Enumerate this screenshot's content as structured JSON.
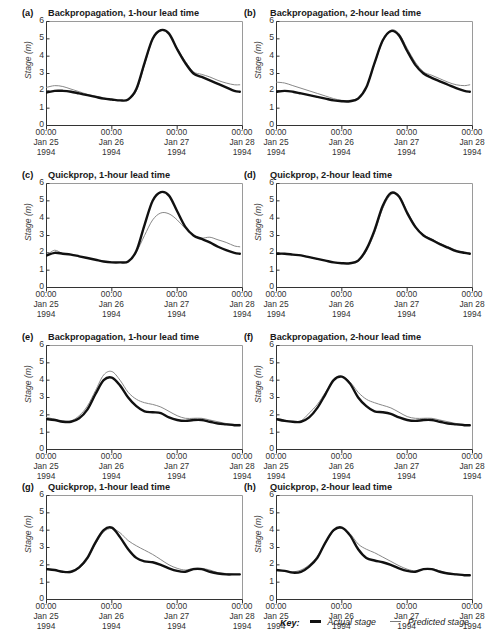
{
  "figure": {
    "axis": {
      "ylabel": "Stage (m)",
      "yticks": [
        "6",
        "5",
        "4",
        "3",
        "2",
        "1",
        "0"
      ],
      "ylim": [
        0,
        6
      ],
      "xticks": [
        {
          "time": "00:00",
          "date": "Jan 25",
          "year": "1994"
        },
        {
          "time": "00:00",
          "date": "Jan 26",
          "year": "1994"
        },
        {
          "time": "00:00",
          "date": "Jan 27",
          "year": "1994"
        },
        {
          "time": "00:00",
          "date": "Jan 28",
          "year": "1994"
        }
      ]
    },
    "key": {
      "label": "Key:",
      "items": [
        {
          "name": "actual-stage",
          "text": "Actual stage",
          "color": "#111111",
          "width": 2.6
        },
        {
          "name": "predicted-stage",
          "text": "Predicted stage",
          "color": "#7a7a7a",
          "width": 1.2
        }
      ]
    },
    "panels": [
      {
        "letter": "(a)",
        "title": "Backpropagation, 1-hour lead time"
      },
      {
        "letter": "(b)",
        "title": "Backpropagation, 2-hour lead time"
      },
      {
        "letter": "(c)",
        "title": "Quickprop, 1-hour lead time"
      },
      {
        "letter": "(d)",
        "title": "Quickprop, 2-hour lead time"
      },
      {
        "letter": "(e)",
        "title": "Backpropagation, 1-hour lead time"
      },
      {
        "letter": "(f)",
        "title": "Backpropagation, 2-hour lead time"
      },
      {
        "letter": "(g)",
        "title": "Quickprop, 1-hour lead time"
      },
      {
        "letter": "(h)",
        "title": "Quickprop, 2-hour lead time"
      }
    ]
  },
  "chart_data": [
    {
      "panel": "(a)",
      "type": "line",
      "title": "Backpropagation, 1-hour lead time",
      "xlabel": "",
      "ylabel": "Stage (m)",
      "ylim": [
        0,
        6
      ],
      "xlim": [
        0,
        72
      ],
      "x_unit": "hours from 00:00 Jan 25 1994",
      "grid": false,
      "legend": "bottom",
      "x": [
        0,
        3,
        6,
        9,
        12,
        15,
        18,
        21,
        24,
        27,
        30,
        33,
        36,
        39,
        42,
        45,
        48,
        51,
        54,
        57,
        60,
        63,
        66,
        69,
        71
      ],
      "series": [
        {
          "name": "Actual stage",
          "values": [
            1.9,
            2.0,
            2.0,
            1.95,
            1.85,
            1.75,
            1.65,
            1.55,
            1.5,
            1.45,
            1.5,
            2.1,
            3.6,
            5.0,
            5.5,
            5.3,
            4.4,
            3.6,
            3.0,
            2.8,
            2.6,
            2.4,
            2.2,
            2.0,
            1.95
          ]
        },
        {
          "name": "Predicted stage",
          "values": [
            2.2,
            2.3,
            2.25,
            2.1,
            1.95,
            1.8,
            1.7,
            1.6,
            1.5,
            1.45,
            1.5,
            2.0,
            3.5,
            4.95,
            5.45,
            5.3,
            4.45,
            3.7,
            3.1,
            2.95,
            2.8,
            2.6,
            2.45,
            2.35,
            2.35
          ]
        }
      ]
    },
    {
      "panel": "(b)",
      "type": "line",
      "title": "Backpropagation, 2-hour lead time",
      "xlabel": "",
      "ylabel": "Stage (m)",
      "ylim": [
        0,
        6
      ],
      "xlim": [
        0,
        72
      ],
      "x_unit": "hours from 00:00 Jan 25 1994",
      "grid": false,
      "legend": "bottom",
      "x": [
        0,
        3,
        6,
        9,
        12,
        15,
        18,
        21,
        24,
        27,
        30,
        33,
        36,
        39,
        42,
        45,
        48,
        51,
        54,
        57,
        60,
        63,
        66,
        69,
        71
      ],
      "series": [
        {
          "name": "Actual stage",
          "values": [
            1.95,
            2.0,
            1.95,
            1.85,
            1.75,
            1.65,
            1.55,
            1.45,
            1.4,
            1.4,
            1.55,
            2.2,
            3.6,
            4.9,
            5.45,
            5.2,
            4.3,
            3.5,
            3.0,
            2.75,
            2.55,
            2.35,
            2.15,
            2.0,
            1.95
          ]
        },
        {
          "name": "Predicted stage",
          "values": [
            2.5,
            2.45,
            2.3,
            2.15,
            2.0,
            1.85,
            1.7,
            1.55,
            1.45,
            1.45,
            1.6,
            2.2,
            3.55,
            4.85,
            5.5,
            5.3,
            4.45,
            3.65,
            3.1,
            2.9,
            2.7,
            2.5,
            2.35,
            2.3,
            2.35
          ]
        }
      ]
    },
    {
      "panel": "(c)",
      "type": "line",
      "title": "Quickprop, 1-hour lead time",
      "xlabel": "",
      "ylabel": "Stage (m)",
      "ylim": [
        0,
        6
      ],
      "xlim": [
        0,
        72
      ],
      "x_unit": "hours from 00:00 Jan 25 1994",
      "grid": false,
      "legend": "bottom",
      "x": [
        0,
        3,
        6,
        9,
        12,
        15,
        18,
        21,
        24,
        27,
        30,
        33,
        36,
        39,
        42,
        45,
        48,
        51,
        54,
        57,
        60,
        63,
        66,
        69,
        71
      ],
      "series": [
        {
          "name": "Actual stage",
          "values": [
            1.85,
            2.0,
            1.95,
            1.9,
            1.8,
            1.7,
            1.6,
            1.5,
            1.45,
            1.45,
            1.5,
            2.1,
            3.6,
            5.0,
            5.5,
            5.3,
            4.4,
            3.5,
            3.0,
            2.8,
            2.6,
            2.35,
            2.15,
            2.0,
            1.95
          ]
        },
        {
          "name": "Predicted stage",
          "values": [
            1.85,
            2.15,
            1.95,
            1.9,
            1.8,
            1.7,
            1.6,
            1.5,
            1.45,
            1.45,
            1.5,
            2.05,
            3.0,
            3.9,
            4.3,
            4.25,
            3.9,
            3.4,
            3.0,
            2.85,
            2.9,
            2.75,
            2.6,
            2.4,
            2.35
          ]
        }
      ]
    },
    {
      "panel": "(d)",
      "type": "line",
      "title": "Quickprop, 2-hour lead time",
      "xlabel": "",
      "ylabel": "Stage (m)",
      "ylim": [
        0,
        6
      ],
      "xlim": [
        0,
        72
      ],
      "x_unit": "hours from 00:00 Jan 25 1994",
      "grid": false,
      "legend": "bottom",
      "x": [
        0,
        3,
        6,
        9,
        12,
        15,
        18,
        21,
        24,
        27,
        30,
        33,
        36,
        39,
        42,
        45,
        48,
        51,
        54,
        57,
        60,
        63,
        66,
        69,
        71
      ],
      "series": [
        {
          "name": "Actual stage",
          "values": [
            1.95,
            1.95,
            1.9,
            1.85,
            1.75,
            1.65,
            1.55,
            1.45,
            1.4,
            1.4,
            1.55,
            2.2,
            3.3,
            4.7,
            5.45,
            5.25,
            4.3,
            3.5,
            3.0,
            2.75,
            2.5,
            2.3,
            2.1,
            2.0,
            1.95
          ]
        },
        {
          "name": "Predicted stage",
          "values": [
            1.95,
            1.95,
            1.9,
            1.85,
            1.75,
            1.65,
            1.55,
            1.45,
            1.4,
            1.4,
            1.5,
            2.1,
            3.15,
            4.55,
            5.35,
            5.3,
            4.4,
            3.55,
            3.05,
            2.8,
            2.55,
            2.35,
            2.15,
            2.05,
            2.0
          ]
        }
      ]
    },
    {
      "panel": "(e)",
      "type": "line",
      "title": "Backpropagation, 1-hour lead time",
      "xlabel": "",
      "ylabel": "Stage (m)",
      "ylim": [
        0,
        6
      ],
      "xlim": [
        0,
        72
      ],
      "x_unit": "hours from 00:00 Jan 25 1994",
      "grid": false,
      "legend": "bottom",
      "x": [
        0,
        3,
        6,
        9,
        12,
        15,
        18,
        21,
        24,
        27,
        30,
        33,
        36,
        39,
        42,
        45,
        48,
        51,
        54,
        57,
        60,
        63,
        66,
        69,
        71
      ],
      "series": [
        {
          "name": "Actual stage",
          "values": [
            1.75,
            1.7,
            1.6,
            1.6,
            1.8,
            2.3,
            3.2,
            4.0,
            4.15,
            3.7,
            3.0,
            2.5,
            2.2,
            2.15,
            2.1,
            1.85,
            1.7,
            1.65,
            1.7,
            1.7,
            1.6,
            1.5,
            1.45,
            1.4,
            1.4
          ]
        },
        {
          "name": "Predicted stage",
          "values": [
            1.85,
            1.75,
            1.65,
            1.65,
            1.95,
            2.5,
            3.4,
            4.3,
            4.5,
            4.0,
            3.3,
            2.9,
            2.7,
            2.6,
            2.45,
            2.2,
            1.95,
            1.8,
            1.8,
            1.8,
            1.7,
            1.6,
            1.5,
            1.45,
            1.45
          ]
        }
      ]
    },
    {
      "panel": "(f)",
      "type": "line",
      "title": "Backpropagation, 2-hour lead time",
      "xlabel": "",
      "ylabel": "Stage (m)",
      "ylim": [
        0,
        6
      ],
      "xlim": [
        0,
        72
      ],
      "x_unit": "hours from 00:00 Jan 25 1994",
      "grid": false,
      "legend": "bottom",
      "x": [
        0,
        3,
        6,
        9,
        12,
        15,
        18,
        21,
        24,
        27,
        30,
        33,
        36,
        39,
        42,
        45,
        48,
        51,
        54,
        57,
        60,
        63,
        66,
        69,
        71
      ],
      "series": [
        {
          "name": "Actual stage",
          "values": [
            1.75,
            1.65,
            1.6,
            1.6,
            1.85,
            2.4,
            3.2,
            4.0,
            4.2,
            3.8,
            3.0,
            2.5,
            2.2,
            2.15,
            2.05,
            1.85,
            1.7,
            1.65,
            1.7,
            1.7,
            1.6,
            1.5,
            1.45,
            1.4,
            1.4
          ]
        },
        {
          "name": "Predicted stage",
          "values": [
            1.8,
            1.7,
            1.6,
            1.65,
            2.1,
            2.6,
            3.3,
            4.0,
            4.2,
            3.9,
            3.3,
            2.9,
            2.7,
            2.55,
            2.4,
            2.15,
            1.9,
            1.8,
            1.8,
            1.8,
            1.7,
            1.6,
            1.5,
            1.45,
            1.4
          ]
        }
      ]
    },
    {
      "panel": "(g)",
      "type": "line",
      "title": "Quickprop, 1-hour lead time",
      "xlabel": "",
      "ylabel": "Stage (m)",
      "ylim": [
        0,
        6
      ],
      "xlim": [
        0,
        72
      ],
      "x_unit": "hours from 00:00 Jan 25 1994",
      "grid": false,
      "legend": "bottom",
      "x": [
        0,
        3,
        6,
        9,
        12,
        15,
        18,
        21,
        24,
        27,
        30,
        33,
        36,
        39,
        42,
        45,
        48,
        51,
        54,
        57,
        60,
        63,
        66,
        69,
        71
      ],
      "series": [
        {
          "name": "Actual stage",
          "values": [
            1.75,
            1.7,
            1.6,
            1.6,
            1.85,
            2.4,
            3.3,
            4.0,
            4.15,
            3.6,
            2.9,
            2.4,
            2.2,
            2.15,
            2.0,
            1.8,
            1.65,
            1.6,
            1.75,
            1.75,
            1.6,
            1.5,
            1.45,
            1.45,
            1.45
          ]
        },
        {
          "name": "Predicted stage",
          "values": [
            1.75,
            1.7,
            1.6,
            1.55,
            1.8,
            2.3,
            3.2,
            3.9,
            4.1,
            3.85,
            3.4,
            3.1,
            2.85,
            2.6,
            2.3,
            2.0,
            1.8,
            1.7,
            1.8,
            1.8,
            1.7,
            1.55,
            1.5,
            1.45,
            1.45
          ]
        }
      ]
    },
    {
      "panel": "(h)",
      "type": "line",
      "title": "Quickprop, 2-hour lead time",
      "xlabel": "",
      "ylabel": "Stage (m)",
      "ylim": [
        0,
        6
      ],
      "xlim": [
        0,
        72
      ],
      "x_unit": "hours from 00:00 Jan 25 1994",
      "grid": false,
      "legend": "bottom",
      "x": [
        0,
        3,
        6,
        9,
        12,
        15,
        18,
        21,
        24,
        27,
        30,
        33,
        36,
        39,
        42,
        45,
        48,
        51,
        54,
        57,
        60,
        63,
        66,
        69,
        71
      ],
      "series": [
        {
          "name": "Actual stage",
          "values": [
            1.7,
            1.65,
            1.55,
            1.6,
            1.9,
            2.4,
            3.3,
            4.0,
            4.15,
            3.7,
            2.9,
            2.4,
            2.25,
            2.15,
            2.0,
            1.8,
            1.65,
            1.6,
            1.75,
            1.75,
            1.6,
            1.5,
            1.45,
            1.4,
            1.4
          ]
        },
        {
          "name": "Predicted stage",
          "values": [
            1.7,
            1.65,
            1.6,
            1.7,
            2.0,
            2.5,
            3.25,
            3.95,
            4.1,
            3.8,
            3.2,
            2.9,
            2.7,
            2.45,
            2.2,
            1.95,
            1.75,
            1.65,
            1.75,
            1.78,
            1.65,
            1.52,
            1.47,
            1.42,
            1.4
          ]
        }
      ]
    }
  ]
}
